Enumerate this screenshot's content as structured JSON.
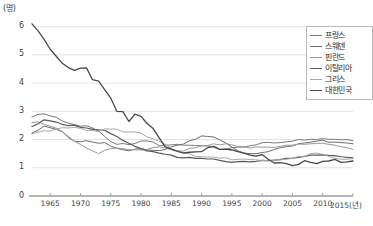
{
  "chart_data": {
    "type": "line",
    "title": "",
    "subtitle": "",
    "xlabel": "2015(년)",
    "ylabel": "(명)",
    "y_unit_label": "(명)",
    "xlim": [
      1962,
      2015
    ],
    "ylim": [
      0,
      6.2
    ],
    "grid": true,
    "grid_axis": "y",
    "legend_position": "top-right",
    "yticks": [
      "0",
      "1",
      "2",
      "3",
      "4",
      "5",
      "6"
    ],
    "ytick_values": [
      0,
      1,
      2,
      3,
      4,
      5,
      6
    ],
    "xticks": [
      "1965",
      "1970",
      "1975",
      "1980",
      "1985",
      "1990",
      "1995",
      "2000",
      "2005",
      "2010",
      "2015(년)"
    ],
    "xtick_values": [
      1965,
      1970,
      1975,
      1980,
      1985,
      1990,
      1995,
      2000,
      2005,
      2010,
      2015
    ],
    "x": [
      1962,
      1963,
      1964,
      1965,
      1966,
      1967,
      1968,
      1969,
      1970,
      1971,
      1972,
      1973,
      1974,
      1975,
      1976,
      1977,
      1978,
      1979,
      1980,
      1981,
      1982,
      1983,
      1984,
      1985,
      1986,
      1987,
      1988,
      1989,
      1990,
      1991,
      1992,
      1993,
      1994,
      1995,
      1996,
      1997,
      1998,
      1999,
      2000,
      2001,
      2002,
      2003,
      2004,
      2005,
      2006,
      2007,
      2008,
      2009,
      2010,
      2011,
      2012,
      2013,
      2014,
      2015
    ],
    "series": [
      {
        "name": "프랑스",
        "color": "#7a7a7a",
        "width": 1.0,
        "values": [
          2.8,
          2.89,
          2.91,
          2.84,
          2.79,
          2.66,
          2.58,
          2.53,
          2.47,
          2.49,
          2.41,
          2.3,
          2.11,
          1.93,
          1.83,
          1.86,
          1.82,
          1.86,
          1.95,
          1.95,
          1.91,
          1.78,
          1.8,
          1.81,
          1.83,
          1.8,
          1.8,
          1.79,
          1.78,
          1.77,
          1.73,
          1.65,
          1.66,
          1.71,
          1.73,
          1.73,
          1.78,
          1.81,
          1.89,
          1.9,
          1.88,
          1.89,
          1.92,
          1.94,
          2.0,
          1.98,
          2.01,
          2.0,
          2.03,
          2.01,
          2.01,
          1.99,
          2.0,
          1.96
        ]
      },
      {
        "name": "스웨덴",
        "color": "#6b6b6b",
        "width": 1.0,
        "values": [
          2.23,
          2.33,
          2.48,
          2.42,
          2.36,
          2.28,
          2.07,
          1.94,
          1.92,
          1.96,
          1.91,
          1.87,
          1.89,
          1.77,
          1.69,
          1.64,
          1.6,
          1.66,
          1.68,
          1.63,
          1.62,
          1.61,
          1.65,
          1.74,
          1.8,
          1.84,
          1.96,
          2.01,
          2.13,
          2.11,
          2.09,
          1.99,
          1.88,
          1.73,
          1.6,
          1.52,
          1.5,
          1.5,
          1.54,
          1.57,
          1.65,
          1.71,
          1.75,
          1.77,
          1.85,
          1.88,
          1.91,
          1.94,
          1.98,
          1.9,
          1.91,
          1.89,
          1.88,
          1.85
        ]
      },
      {
        "name": "핀란드",
        "color": "#999999",
        "width": 1.0,
        "values": [
          2.6,
          2.63,
          2.54,
          2.47,
          2.4,
          2.28,
          2.11,
          1.94,
          1.83,
          1.7,
          1.6,
          1.5,
          1.62,
          1.68,
          1.7,
          1.68,
          1.64,
          1.64,
          1.63,
          1.65,
          1.72,
          1.74,
          1.7,
          1.64,
          1.6,
          1.59,
          1.69,
          1.71,
          1.78,
          1.79,
          1.85,
          1.81,
          1.85,
          1.81,
          1.76,
          1.75,
          1.7,
          1.74,
          1.73,
          1.73,
          1.72,
          1.76,
          1.8,
          1.8,
          1.84,
          1.83,
          1.85,
          1.86,
          1.87,
          1.83,
          1.8,
          1.75,
          1.71,
          1.65
        ]
      },
      {
        "name": "이탈리아",
        "color": "#5a5a5a",
        "width": 1.2,
        "values": [
          2.46,
          2.56,
          2.7,
          2.66,
          2.62,
          2.54,
          2.49,
          2.51,
          2.43,
          2.41,
          2.36,
          2.34,
          2.33,
          2.21,
          2.11,
          1.97,
          1.87,
          1.76,
          1.68,
          1.6,
          1.57,
          1.52,
          1.48,
          1.45,
          1.37,
          1.35,
          1.37,
          1.33,
          1.33,
          1.31,
          1.31,
          1.26,
          1.22,
          1.19,
          1.22,
          1.23,
          1.21,
          1.23,
          1.26,
          1.25,
          1.27,
          1.29,
          1.33,
          1.34,
          1.37,
          1.4,
          1.45,
          1.45,
          1.46,
          1.44,
          1.43,
          1.39,
          1.37,
          1.35
        ]
      },
      {
        "name": "그리스",
        "color": "#a8a8a8",
        "width": 1.0,
        "values": [
          2.21,
          2.26,
          2.31,
          2.3,
          2.37,
          2.42,
          2.41,
          2.43,
          2.4,
          2.32,
          2.32,
          2.28,
          2.38,
          2.37,
          2.37,
          2.27,
          2.27,
          2.27,
          2.23,
          2.09,
          2.03,
          1.94,
          1.83,
          1.68,
          1.6,
          1.51,
          1.5,
          1.4,
          1.39,
          1.38,
          1.38,
          1.34,
          1.36,
          1.28,
          1.3,
          1.31,
          1.29,
          1.28,
          1.26,
          1.25,
          1.27,
          1.28,
          1.3,
          1.33,
          1.4,
          1.41,
          1.5,
          1.52,
          1.48,
          1.4,
          1.34,
          1.3,
          1.3,
          1.33
        ]
      },
      {
        "name": "대한민국",
        "color": "#4a4a4a",
        "width": 1.3,
        "values": [
          6.1,
          5.85,
          5.55,
          5.2,
          4.95,
          4.7,
          4.55,
          4.45,
          4.53,
          4.54,
          4.12,
          4.07,
          3.77,
          3.47,
          3.0,
          2.99,
          2.64,
          2.9,
          2.82,
          2.57,
          2.39,
          2.06,
          1.74,
          1.66,
          1.58,
          1.53,
          1.55,
          1.56,
          1.57,
          1.71,
          1.76,
          1.65,
          1.66,
          1.63,
          1.57,
          1.52,
          1.45,
          1.41,
          1.47,
          1.3,
          1.17,
          1.18,
          1.15,
          1.08,
          1.12,
          1.25,
          1.19,
          1.15,
          1.23,
          1.24,
          1.3,
          1.19,
          1.21,
          1.24
        ]
      }
    ]
  },
  "legend": {
    "items": [
      {
        "label": "프랑스"
      },
      {
        "label": "스웨덴"
      },
      {
        "label": "핀란드"
      },
      {
        "label": "이탈리아"
      },
      {
        "label": "그리스"
      },
      {
        "label": "대한민국"
      }
    ]
  }
}
